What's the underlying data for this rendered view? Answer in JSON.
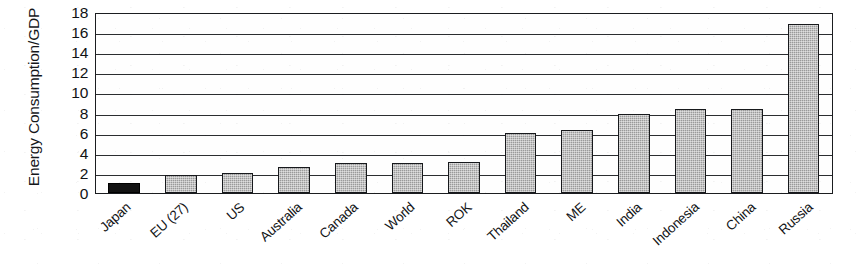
{
  "chart_data": {
    "type": "bar",
    "title": "",
    "xlabel": "",
    "ylabel": "Energy Consumption/GDP",
    "ylim": [
      0,
      18
    ],
    "ytick_step": 2,
    "yticks": [
      18,
      16,
      14,
      12,
      10,
      8,
      6,
      4,
      2,
      0
    ],
    "grid": true,
    "legend": "none",
    "categories": [
      "Japan",
      "EU (27)",
      "US",
      "Australia",
      "Canada",
      "World",
      "ROK",
      "Thailand",
      "ME",
      "India",
      "Indonesia",
      "China",
      "Russia"
    ],
    "values": [
      1.0,
      1.8,
      2.0,
      2.6,
      3.0,
      3.0,
      3.1,
      6.0,
      6.3,
      7.9,
      8.4,
      8.4,
      16.8
    ],
    "bars": [
      {
        "label": "Japan",
        "value": 1.0,
        "style": "solid-black"
      },
      {
        "label": "EU (27)",
        "value": 1.8,
        "style": "hatched-gray"
      },
      {
        "label": "US",
        "value": 2.0,
        "style": "hatched-gray"
      },
      {
        "label": "Australia",
        "value": 2.6,
        "style": "hatched-gray"
      },
      {
        "label": "Canada",
        "value": 3.0,
        "style": "hatched-gray"
      },
      {
        "label": "World",
        "value": 3.0,
        "style": "hatched-gray"
      },
      {
        "label": "ROK",
        "value": 3.1,
        "style": "hatched-gray"
      },
      {
        "label": "Thailand",
        "value": 6.0,
        "style": "hatched-gray"
      },
      {
        "label": "ME",
        "value": 6.3,
        "style": "hatched-gray"
      },
      {
        "label": "India",
        "value": 7.9,
        "style": "hatched-gray"
      },
      {
        "label": "Indonesia",
        "value": 8.4,
        "style": "hatched-gray"
      },
      {
        "label": "China",
        "value": 8.4,
        "style": "hatched-gray"
      },
      {
        "label": "Russia",
        "value": 16.8,
        "style": "hatched-gray"
      }
    ],
    "colors": {
      "bar_fill": "#9a9a9a",
      "bar_highlight_fill": "#121212",
      "bar_border": "#17191c",
      "gridline": "#2b2d30",
      "axis": "#1b1d20",
      "text": "#121416",
      "background": "#ffffff"
    }
  }
}
